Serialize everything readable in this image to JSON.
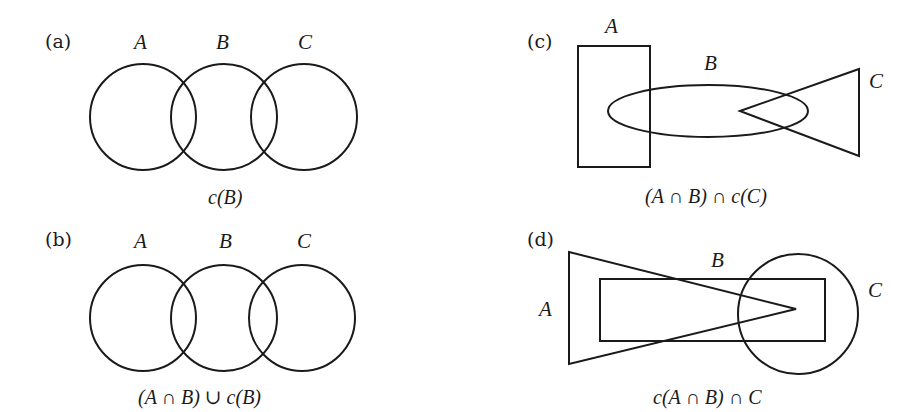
{
  "panels": [
    {
      "id": "a",
      "label": "(a)",
      "sets": [
        "A",
        "B",
        "C"
      ],
      "shapes": [
        "circle",
        "circle",
        "circle"
      ],
      "caption": "c(B)"
    },
    {
      "id": "b",
      "label": "(b)",
      "sets": [
        "A",
        "B",
        "C"
      ],
      "shapes": [
        "circle",
        "circle",
        "circle"
      ],
      "caption": "(A ∩ B) ∪ c(B)"
    },
    {
      "id": "c",
      "label": "(c)",
      "sets": [
        "A",
        "B",
        "C"
      ],
      "shapes": [
        "rectangle",
        "ellipse",
        "triangle"
      ],
      "caption": "(A ∩ B) ∩ c(C)"
    },
    {
      "id": "d",
      "label": "(d)",
      "sets": [
        "A",
        "B",
        "C"
      ],
      "shapes": [
        "triangle",
        "rectangle",
        "circle"
      ],
      "caption": "c(A ∩ B) ∩ C"
    }
  ]
}
